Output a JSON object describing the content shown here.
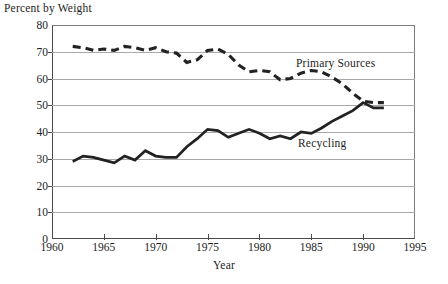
{
  "chart_data": {
    "type": "line",
    "title": "",
    "ylabel": "Percent by Weight",
    "xlabel": "Year",
    "xlim": [
      1960,
      1995
    ],
    "ylim": [
      0,
      80
    ],
    "xticks": [
      1960,
      1965,
      1970,
      1975,
      1980,
      1985,
      1990,
      1995
    ],
    "yticks": [
      0,
      10,
      20,
      30,
      40,
      50,
      60,
      70,
      80
    ],
    "grid": "horizontal",
    "legend_position": "inline-annotation",
    "series": [
      {
        "name": "Primary Sources",
        "style": "dashed",
        "color": "#222222",
        "x": [
          1962,
          1963,
          1964,
          1965,
          1966,
          1967,
          1968,
          1969,
          1970,
          1971,
          1972,
          1973,
          1974,
          1975,
          1976,
          1977,
          1978,
          1979,
          1980,
          1981,
          1982,
          1983,
          1984,
          1985,
          1986,
          1987,
          1988,
          1989,
          1990,
          1991,
          1992
        ],
        "values": [
          72,
          71.5,
          70.5,
          71,
          70.5,
          72,
          71.5,
          70.5,
          71.5,
          70,
          69.5,
          66,
          67,
          70.5,
          71,
          69,
          65,
          62.5,
          63,
          62.5,
          59.5,
          60,
          62,
          63,
          62.5,
          60.5,
          58,
          54.5,
          51.5,
          51,
          51
        ]
      },
      {
        "name": "Recycling",
        "style": "solid",
        "color": "#222222",
        "x": [
          1962,
          1963,
          1964,
          1965,
          1966,
          1967,
          1968,
          1969,
          1970,
          1971,
          1972,
          1973,
          1974,
          1975,
          1976,
          1977,
          1978,
          1979,
          1980,
          1981,
          1982,
          1983,
          1984,
          1985,
          1986,
          1987,
          1988,
          1989,
          1990,
          1991,
          1992
        ],
        "values": [
          29,
          31,
          30.5,
          29.5,
          28.5,
          31,
          29.5,
          33,
          31,
          30.5,
          30.5,
          34.5,
          37.5,
          41,
          40.5,
          38,
          39.5,
          41,
          39.5,
          37.5,
          38.5,
          37.5,
          40,
          39.5,
          41.5,
          44,
          46,
          48,
          51,
          49,
          49
        ]
      }
    ],
    "annotations": [
      {
        "text": "Primary Sources",
        "series": "Primary Sources"
      },
      {
        "text": "Recycling",
        "series": "Recycling"
      }
    ]
  },
  "axes": {
    "y_title": "Percent by Weight",
    "x_title": "Year",
    "y_tick_labels": [
      "80",
      "70",
      "60",
      "50",
      "40",
      "30",
      "20",
      "10",
      "0"
    ],
    "x_tick_labels": [
      "1960",
      "1965",
      "1970",
      "1975",
      "1980",
      "1985",
      "1990",
      "1995"
    ]
  },
  "labels": {
    "primary_sources": "Primary Sources",
    "recycling": "Recycling"
  }
}
